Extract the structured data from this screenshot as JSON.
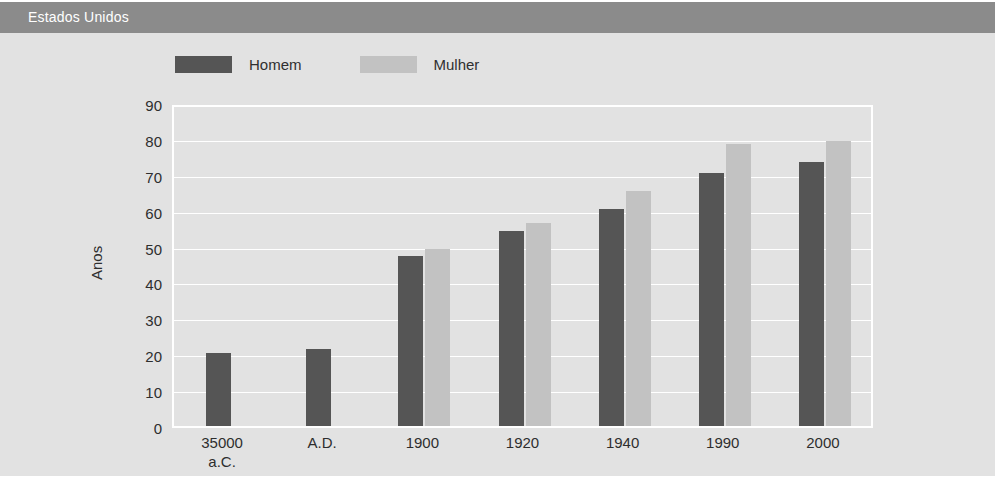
{
  "header": {
    "title": "Estados Unidos"
  },
  "chart_data": {
    "type": "bar",
    "title": "",
    "xlabel": "",
    "ylabel": "Anos",
    "ylim": [
      0,
      90
    ],
    "ytick_step": 10,
    "yticks": [
      90,
      80,
      70,
      60,
      50,
      40,
      30,
      20,
      10,
      0
    ],
    "grid": true,
    "legend_position": "top-left",
    "categories": [
      "35000\na.C.",
      "A.D.",
      "1900",
      "1920",
      "1940",
      "1990",
      "2000"
    ],
    "series": [
      {
        "name": "Homem",
        "color": "#555555",
        "values": [
          21,
          22,
          48,
          55,
          61,
          71,
          74
        ]
      },
      {
        "name": "Mulher",
        "color": "#c2c2c2",
        "values": [
          null,
          null,
          50,
          57,
          66,
          79,
          80
        ]
      }
    ]
  },
  "colors": {
    "title_bar": "#8b8b8b",
    "panel_background": "#e2e2e2",
    "gridline": "#ffffff",
    "axis_text": "#2e2e2e",
    "title_text": "#ffffff"
  }
}
